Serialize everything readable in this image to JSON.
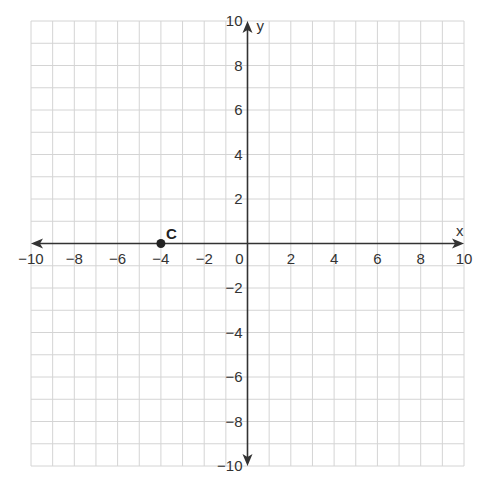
{
  "chart_data": {
    "type": "scatter",
    "title": "",
    "xlabel": "x",
    "ylabel": "y",
    "xlim": [
      -10,
      10
    ],
    "ylim": [
      -10,
      10
    ],
    "grid": true,
    "grid_step": 1,
    "x_ticks": [
      -10,
      -8,
      -6,
      -4,
      -2,
      0,
      2,
      4,
      6,
      8,
      10
    ],
    "y_ticks": [
      -10,
      -8,
      -6,
      -4,
      -2,
      2,
      4,
      6,
      8,
      10
    ],
    "x_tick_labels": [
      "−10",
      "−8",
      "−6",
      "−4",
      "−2",
      "0",
      "2",
      "4",
      "6",
      "8",
      "10"
    ],
    "y_tick_labels": [
      "−10",
      "−8",
      "−6",
      "−4",
      "−2",
      "2",
      "4",
      "6",
      "8",
      "10"
    ],
    "points": [
      {
        "label": "C",
        "x": -4,
        "y": 0
      }
    ],
    "legend": null
  },
  "colors": {
    "grid": "#d4d4d4",
    "axis": "#333333",
    "point": "#222222"
  }
}
